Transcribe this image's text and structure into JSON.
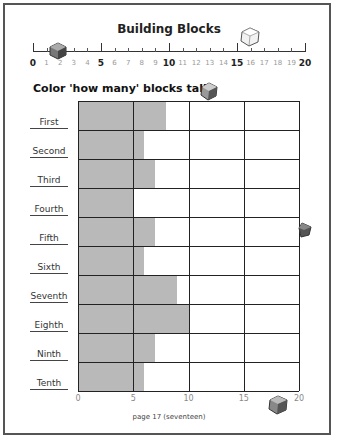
{
  "title": "Building Blocks",
  "subtitle": "Color 'how many' blocks tall.",
  "footer": "page 17 (seventeen)",
  "ruler": {
    "labels": [
      "0",
      "1",
      "2",
      "3",
      "4",
      "5",
      "6",
      "7",
      "8",
      "9",
      "10",
      "11",
      "12",
      "13",
      "14",
      "15",
      "16",
      "17",
      "18",
      "19",
      "20"
    ]
  },
  "x_axis_labels": [
    "0",
    "5",
    "10",
    "15",
    "20"
  ],
  "rows": [
    {
      "label": "First"
    },
    {
      "label": "Second"
    },
    {
      "label": "Third"
    },
    {
      "label": "Fourth"
    },
    {
      "label": "Fifth"
    },
    {
      "label": "Sixth"
    },
    {
      "label": "Seventh"
    },
    {
      "label": "Eighth"
    },
    {
      "label": "Ninth"
    },
    {
      "label": "Tenth"
    }
  ],
  "colors": {
    "bar": "#b9b9b9",
    "grid": "#222222"
  },
  "chart_data": {
    "type": "bar",
    "orientation": "horizontal",
    "title": "Building Blocks",
    "subtitle": "Color 'how many' blocks tall.",
    "categories": [
      "First",
      "Second",
      "Third",
      "Fourth",
      "Fifth",
      "Sixth",
      "Seventh",
      "Eighth",
      "Ninth",
      "Tenth"
    ],
    "values": [
      8,
      6,
      7,
      5,
      7,
      6,
      9,
      10,
      7,
      6
    ],
    "xlabel": "",
    "ylabel": "",
    "xlim": [
      0,
      20
    ],
    "xticks": [
      0,
      5,
      10,
      15,
      20
    ],
    "grid": true,
    "legend": null
  }
}
